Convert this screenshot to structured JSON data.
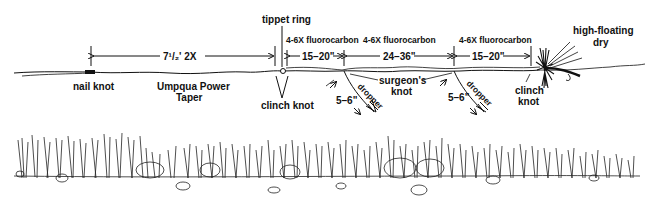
{
  "diagram": {
    "labels": {
      "tippet_ring": "tippet ring",
      "leader_length": "7¹/₂' 2X",
      "nail_knot": "nail knot",
      "taper_line1": "Umpqua Power",
      "taper_line2": "Taper",
      "clinch_knot_1": "clinch knot",
      "fluoro_1": "4-6X fluorocarbon",
      "fluoro_1_len": "15–20\"",
      "fluoro_2": "4-6X fluorocarbon",
      "fluoro_2_len": "24–36\"",
      "fluoro_3": "4-6X fluorocarbon",
      "fluoro_3_len": "15–20\"",
      "surgeons_line1": "surgeon's",
      "surgeons_line2": "knot",
      "dropper_1": "dropper",
      "dropper_1_len": "5–6\"",
      "dropper_2": "dropper",
      "dropper_2_len": "5–6\"",
      "clinch_knot_2_line1": "clinch",
      "clinch_knot_2_line2": "knot",
      "dry_line1": "high-floating",
      "dry_line2": "dry"
    },
    "segments": [
      {
        "name": "leader",
        "material": "2X",
        "length": "7¹/₂'"
      },
      {
        "name": "tippet-1",
        "material": "4-6X fluorocarbon",
        "length": "15–20\""
      },
      {
        "name": "tippet-2",
        "material": "4-6X fluorocarbon",
        "length": "24–36\""
      },
      {
        "name": "tippet-3",
        "material": "4-6X fluorocarbon",
        "length": "15–20\""
      }
    ],
    "droppers": [
      {
        "label": "dropper",
        "length": "5–6\""
      },
      {
        "label": "dropper",
        "length": "5–6\""
      }
    ]
  }
}
